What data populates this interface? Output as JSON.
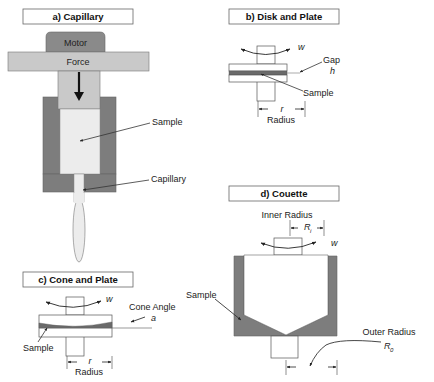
{
  "colors": {
    "dark_gray": "#7d7d7d",
    "mid_gray": "#8a8a8a",
    "light_gray": "#c9c9c9",
    "sample_light": "#ececec",
    "sample_dark": "#666666",
    "outline": "#555555",
    "background": "#ffffff"
  },
  "panels": {
    "capillary": {
      "title": "a) Capillary",
      "motor_label": "Motor",
      "force_label": "Force",
      "sample_label": "Sample",
      "capillary_label": "Capillary"
    },
    "disk_plate": {
      "title": "b) Disk and Plate",
      "rotation_symbol": "w",
      "gap_label": "Gap",
      "gap_symbol": "h",
      "sample_label": "Sample",
      "radius_symbol": "r",
      "radius_label": "Radius"
    },
    "cone_plate": {
      "title": "c) Cone and Plate",
      "rotation_symbol": "w",
      "cone_angle_label": "Cone Angle",
      "angle_symbol": "a",
      "sample_label": "Sample",
      "radius_symbol": "r",
      "radius_label": "Radius"
    },
    "couette": {
      "title": "d) Couette",
      "inner_radius_label": "Inner Radius",
      "inner_radius_symbol": "R",
      "inner_radius_sub": "i",
      "rotation_symbol": "w",
      "sample_label": "Sample",
      "outer_radius_label": "Outer Radius",
      "outer_radius_symbol": "R",
      "outer_radius_sub": "0"
    }
  }
}
